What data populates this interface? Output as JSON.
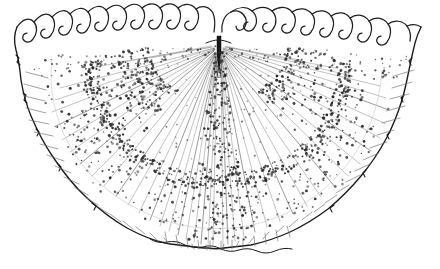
{
  "figure": {
    "domain": "Natural-Image",
    "technique": "pen-and-ink stipple and line drawing",
    "orientation": "dorsal margin uppermost, ventral margin lowermost",
    "caption": "",
    "background_color": "#ffffff",
    "ink_color": "#1a1a1a",
    "stipple_color": "#2a2a2a",
    "ray_color": "#9b9b9b",
    "canvas": {
      "width": 440,
      "height": 269
    }
  },
  "anatomy": {
    "umbo": {
      "label": "umbo",
      "x": 218,
      "y": 40,
      "description": "dark vertical wedge at apex where radiating ribs originate"
    },
    "dorsal_fringe": {
      "label": "serrated dorsal fringe",
      "tooth_count_left": 10,
      "tooth_count_right": 9,
      "tooth_count_total": 19,
      "tooth_shape": "hooked",
      "left_hook_direction": "down-left",
      "right_hook_direction": "down-right",
      "y_baseline": 44,
      "tooth_height": 22
    },
    "radiating_rays": {
      "label": "radiating ribs",
      "count": 58,
      "origin_x": 218,
      "origin_y": 44,
      "spread_degrees": 168
    },
    "inner_arc": {
      "label": "stippled inner arc",
      "description": "dense stipple band marking inner disc boundary"
    },
    "marginal_band": {
      "label": "marginal band",
      "description": "zone of short radial strokes between inner arc and outer margin"
    },
    "outer_margin": {
      "label": "wavy outer margin",
      "description": "irregular undulating contour enclosing the valve"
    },
    "shading": {
      "label": "stipple shading",
      "dense_regions": [
        "left dorsal quadrant",
        "right dorsal quadrant",
        "central axis",
        "ventral margin"
      ],
      "dot_count": 1480
    }
  }
}
